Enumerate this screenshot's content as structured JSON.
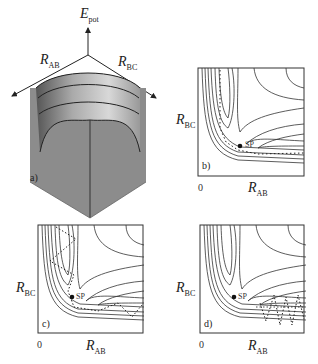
{
  "panel_a": {
    "label": "a)",
    "axis_energy": "E",
    "axis_energy_sub": "pot",
    "axis_ab": "R",
    "axis_ab_sub": "AB",
    "axis_bc": "R",
    "axis_bc_sub": "BC"
  },
  "panels": [
    {
      "label": "b)",
      "y_axis": "R",
      "y_sub": "BC",
      "x_axis": "R",
      "x_sub": "AB",
      "origin": "0",
      "saddle": "SP"
    },
    {
      "label": "c)",
      "y_axis": "R",
      "y_sub": "BC",
      "x_axis": "R",
      "x_sub": "AB",
      "origin": "0",
      "saddle": "SP"
    },
    {
      "label": "d)",
      "y_axis": "R",
      "y_sub": "BC",
      "x_axis": "R",
      "x_sub": "AB",
      "origin": "0",
      "saddle": "SP"
    }
  ]
}
